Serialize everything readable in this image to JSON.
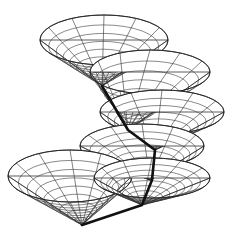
{
  "figure": {
    "type": "light-cones-along-worldline",
    "caption_visible": "",
    "colors": {
      "background": "#ffffff",
      "wire": "#333333",
      "worldline": "#111111"
    },
    "cones": [
      {
        "id": "cone-1",
        "apex": [
          102,
          86
        ],
        "rim_center": [
          104,
          40
        ],
        "rx": 64,
        "ry": 25,
        "rings": 8,
        "rays": 12
      },
      {
        "id": "cone-2",
        "apex": [
          128,
          130
        ],
        "rim_center": [
          150,
          72
        ],
        "rx": 60,
        "ry": 22,
        "rings": 8,
        "rays": 12
      },
      {
        "id": "cone-3",
        "apex": [
          155,
          150
        ],
        "rim_center": [
          162,
          112
        ],
        "rx": 62,
        "ry": 22,
        "rings": 8,
        "rays": 12
      },
      {
        "id": "cone-4",
        "apex": [
          150,
          180
        ],
        "rim_center": [
          142,
          146
        ],
        "rx": 62,
        "ry": 22,
        "rings": 8,
        "rays": 12
      },
      {
        "id": "cone-5",
        "apex": [
          142,
          205
        ],
        "rim_center": [
          152,
          178
        ],
        "rx": 58,
        "ry": 20,
        "rings": 8,
        "rays": 12
      },
      {
        "id": "cone-6",
        "apex": [
          82,
          225
        ],
        "rim_center": [
          70,
          176
        ],
        "rx": 62,
        "ry": 26,
        "rings": 8,
        "rays": 12
      }
    ],
    "worldline": [
      [
        102,
        86
      ],
      [
        128,
        130
      ],
      [
        155,
        150
      ],
      [
        152,
        180
      ],
      [
        142,
        205
      ],
      [
        82,
        225
      ]
    ]
  }
}
